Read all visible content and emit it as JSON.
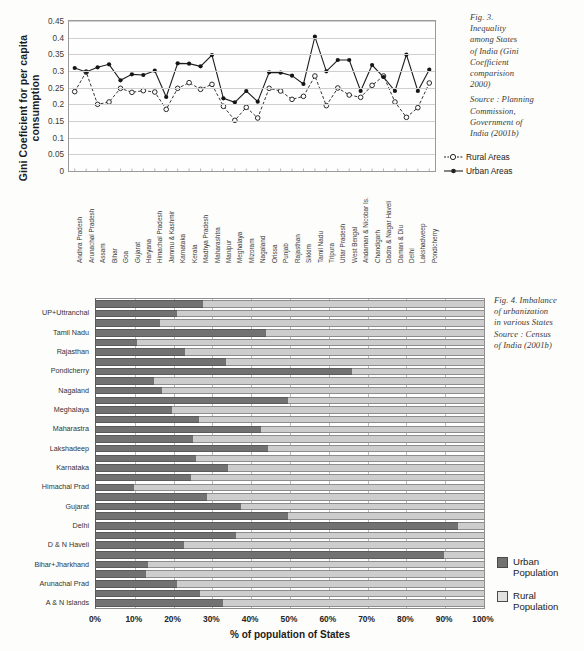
{
  "fig3": {
    "caption_title": "Fig. 3.\nInequality\namong States\nof India (Gini\nCoefficient\ncomparision\n2000)",
    "caption_source": "Source : Planning\nCommission,\nGovernment of\nIndia (2001b)",
    "ylabel": "Gini Coeficient for per capita consumption",
    "legend": [
      {
        "name": "rural",
        "label": "Rural Areas"
      },
      {
        "name": "urban",
        "label": "Urban Areas"
      }
    ],
    "chart_data": {
      "type": "line",
      "title": "Inequality among States of India (Gini Coefficient comparision 2000)",
      "xlabel": "",
      "ylabel": "Gini Coeficient for per capita consumption",
      "ylim": [
        0,
        0.45
      ],
      "yticks": [
        "0",
        "0.05",
        "0.1",
        "0.15",
        "0.2",
        "0.25",
        "0.3",
        "0.35",
        "0.4",
        "0.45"
      ],
      "grid": true,
      "legend_position": "right",
      "categories": [
        "Andhra Pradesh",
        "Arunachal Pradesh",
        "Assam",
        "Bihar",
        "Goa",
        "Gujarat",
        "Haryana",
        "Himachal Pradesh",
        "Jammu & Kashmir",
        "Karnataka",
        "Kerala",
        "Madhya Pradesh",
        "Maharashtra",
        "Manipur",
        "Meghalaya",
        "Mizoram",
        "Nagaland",
        "Orissa",
        "Punjab",
        "Rajasthan",
        "Sikkim",
        "Tamil Nadu",
        "Tripura",
        "Uttar Pradesh",
        "West Bengal",
        "Andaman & Nicobar Is.",
        "Chandigarh",
        "Dadra & Nagar Haveli",
        "Daman & Diu",
        "Delhi",
        "Lakshadweep",
        "Pondicherry"
      ],
      "series": [
        {
          "name": "Rural Areas",
          "values": [
            0.238,
            0.297,
            0.2,
            0.207,
            0.248,
            0.236,
            0.241,
            0.237,
            0.185,
            0.248,
            0.265,
            0.245,
            0.26,
            0.194,
            0.152,
            0.191,
            0.159,
            0.248,
            0.24,
            0.215,
            0.224,
            0.285,
            0.196,
            0.249,
            0.228,
            0.221,
            0.257,
            0.285,
            0.207,
            0.161,
            0.19,
            0.264
          ]
        },
        {
          "name": "Urban Areas",
          "values": [
            0.309,
            0.297,
            0.311,
            0.32,
            0.272,
            0.29,
            0.288,
            0.301,
            0.222,
            0.323,
            0.322,
            0.314,
            0.348,
            0.218,
            0.206,
            0.24,
            0.208,
            0.296,
            0.295,
            0.286,
            0.261,
            0.403,
            0.299,
            0.333,
            0.333,
            0.24,
            0.318,
            0.282,
            0.24,
            0.349,
            0.24,
            0.304
          ]
        }
      ]
    }
  },
  "fig4": {
    "caption": "Fig. 4. Imbalance\nof urbanization\nin various States\nSource : Census\nof India (2001b)",
    "legend": [
      {
        "name": "urban",
        "label": "Urban\nPopulation"
      },
      {
        "name": "rural",
        "label": "Rural\nPopulation"
      }
    ],
    "chart_data": {
      "type": "bar",
      "orientation": "horizontal",
      "stacked": true,
      "stack_total": 100,
      "title": "Imbalance of urbanization in various States",
      "xlabel": "% of population of States",
      "ylabel": "",
      "xlim": [
        0,
        100
      ],
      "xticks": [
        "0%",
        "10%",
        "20%",
        "30%",
        "40%",
        "50%",
        "60%",
        "70%",
        "80%",
        "90%",
        "100%"
      ],
      "grid": true,
      "legend_position": "right",
      "visible_tick_labels": [
        "UP+Uttranchal",
        "Tamil Nadu",
        "Rajasthan",
        "Pondicherry",
        "Nagaland",
        "Meghalaya",
        "Maharastra",
        "Lakshadeep",
        "Karnataka",
        "Himachal Prad",
        "Gujarat",
        "Delhi",
        "D & N Haveli",
        "Bihar+Jharkhand",
        "Arunachal Prad",
        "A & N Islands"
      ],
      "series": [
        {
          "name": "Urban Population",
          "values": [
            27.5,
            20.8,
            16.6,
            43.9,
            10.5,
            22.9,
            33.6,
            66.1,
            14.9,
            17.1,
            49.5,
            19.6,
            26.5,
            42.4,
            24.9,
            44.3,
            25.7,
            33.9,
            24.6,
            9.8,
            28.6,
            37.3,
            49.6,
            93.2,
            36.2,
            22.8,
            89.7,
            13.4,
            12.9,
            20.8,
            26.9,
            32.7
          ]
        },
        {
          "name": "Rural Population",
          "values": [
            72.5,
            79.2,
            83.4,
            56.1,
            89.5,
            77.1,
            66.4,
            33.9,
            85.1,
            82.9,
            50.5,
            80.4,
            73.5,
            57.6,
            75.1,
            55.7,
            74.3,
            66.1,
            75.4,
            90.2,
            71.4,
            62.7,
            50.4,
            6.8,
            63.8,
            77.2,
            10.3,
            86.6,
            87.1,
            79.2,
            73.1,
            67.3
          ]
        }
      ]
    }
  },
  "colors": {
    "urban_bar": "#727272",
    "rural_bar": "#cdcdcd",
    "grid": "#cfcfcf",
    "axis": "#8f8f8f",
    "page_bg": "#fdfdfb"
  }
}
